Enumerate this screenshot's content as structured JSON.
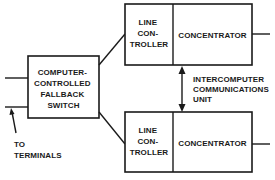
{
  "diagram": {
    "switch": {
      "lines": [
        "COMPUTER-",
        "CONTROLLED",
        "FALLBACK",
        "SWITCH"
      ]
    },
    "top_unit": {
      "line_controller": [
        "LINE",
        "CON-",
        "TROLLER"
      ],
      "concentrator": "CONCENTRATOR"
    },
    "bottom_unit": {
      "line_controller": [
        "LINE",
        "CON-",
        "TROLLER"
      ],
      "concentrator": "CONCENTRATOR"
    },
    "intercomputer_label": [
      "INTERCOMPUTER",
      "COMMUNICATIONS",
      "UNIT"
    ],
    "terminals_label": [
      "TO",
      "TERMINALS"
    ],
    "colors": {
      "ink": "#1a1a1a",
      "background": "#ffffff"
    }
  }
}
